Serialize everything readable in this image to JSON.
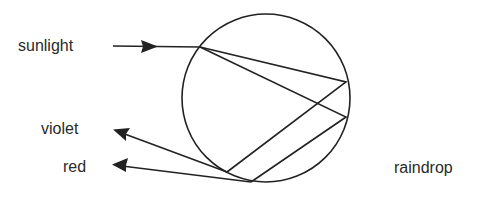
{
  "diagram": {
    "type": "raindrop-dispersion",
    "labels": {
      "sunlight": "sunlight",
      "violet": "violet",
      "red": "red",
      "raindrop": "raindrop"
    },
    "colors": {
      "ink": "#222222",
      "text": "#2a2a2a",
      "background": "#ffffff"
    },
    "raindrop_circle": {
      "cx": 266,
      "cy": 98,
      "r": 84
    },
    "rays": {
      "incoming_sunlight": {
        "from": [
          113,
          46
        ],
        "to": [
          200,
          47
        ]
      },
      "internal_violet": [
        [
          200,
          47
        ],
        [
          346,
          82
        ],
        [
          227,
          172
        ]
      ],
      "internal_red": [
        [
          200,
          47
        ],
        [
          346,
          117
        ],
        [
          251,
          182
        ]
      ],
      "outgoing_violet": {
        "from": [
          227,
          172
        ],
        "to": [
          114,
          130
        ]
      },
      "outgoing_red": {
        "from": [
          251,
          182
        ],
        "to": [
          114,
          165
        ]
      }
    }
  }
}
